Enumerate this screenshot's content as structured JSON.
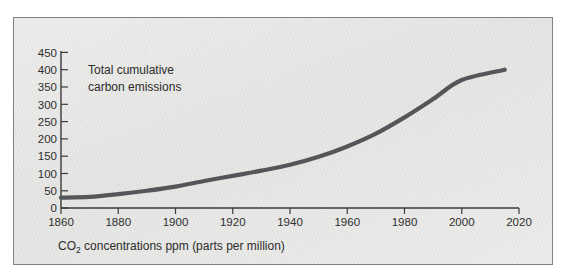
{
  "figure": {
    "panel_background": "#e9e9e7",
    "panel_border_color": "#7f8184",
    "line_color": "#55565a",
    "axis_color": "#3a3a3a",
    "text_color": "#2b2b2b"
  },
  "annotation": {
    "line1": "Total cumulative",
    "line2": "carbon emissions"
  },
  "caption": {
    "prefix": "CO",
    "subscript": "2",
    "suffix": " concentrations ppm (parts per million)"
  },
  "chart_data": {
    "type": "line",
    "title": "",
    "subtitle": "",
    "xlabel": "CO2 concentrations ppm (parts per million)",
    "ylabel": "",
    "xlim": [
      1860,
      2020
    ],
    "ylim": [
      0,
      450
    ],
    "grid": false,
    "legend_position": "none",
    "xticks": [
      1860,
      1880,
      1900,
      1920,
      1940,
      1960,
      1980,
      2000,
      2020
    ],
    "yticks": [
      0,
      50,
      100,
      150,
      200,
      250,
      300,
      350,
      400,
      450
    ],
    "xtick_labels": [
      "1860",
      "1880",
      "1900",
      "1920",
      "1940",
      "1960",
      "1980",
      "2000",
      "2020"
    ],
    "ytick_labels": [
      "0",
      "50",
      "100",
      "150",
      "200",
      "250",
      "300",
      "350",
      "400",
      "450"
    ],
    "annotations": [
      {
        "text": "Total cumulative carbon emissions",
        "x": 1875,
        "y": 400
      }
    ],
    "series": [
      {
        "name": "Total cumulative carbon emissions",
        "color": "#55565a",
        "x": [
          1860,
          1870,
          1880,
          1890,
          1900,
          1910,
          1920,
          1930,
          1940,
          1950,
          1960,
          1970,
          1980,
          1990,
          2000,
          2015
        ],
        "values": [
          30,
          32,
          40,
          50,
          62,
          78,
          93,
          108,
          125,
          148,
          178,
          215,
          262,
          315,
          370,
          400
        ]
      }
    ]
  }
}
